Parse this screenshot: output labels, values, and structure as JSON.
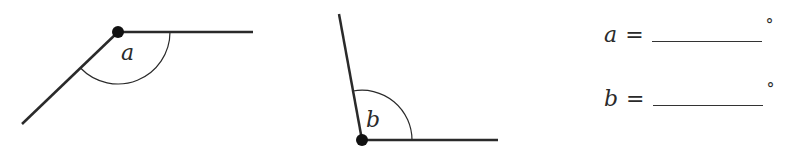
{
  "figure": {
    "angles": [
      {
        "label": "a",
        "vertex": [
          118,
          32
        ],
        "ray_end_1": [
          253,
          32
        ],
        "ray_end_2": [
          22,
          124
        ],
        "arc_radius": 52,
        "label_pos": [
          128,
          58
        ]
      },
      {
        "label": "b",
        "vertex": [
          362,
          140
        ],
        "ray_end_1": [
          339,
          14
        ],
        "ray_end_2": [
          498,
          140
        ],
        "arc_radius": 50,
        "label_pos": [
          372,
          128
        ]
      }
    ],
    "stroke_color": "#2a2a2a"
  },
  "answers": [
    {
      "variable": "a",
      "equals": "=",
      "value": "",
      "unit": "°"
    },
    {
      "variable": "b",
      "equals": "=",
      "value": "",
      "unit": "°"
    }
  ]
}
